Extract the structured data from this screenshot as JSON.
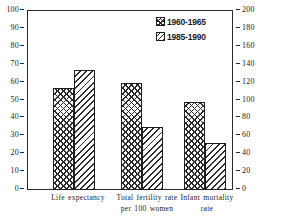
{
  "chart_data": {
    "type": "bar",
    "title": "",
    "subtitle": "",
    "xlabel": "",
    "ylabel": "",
    "grid": false,
    "legend_position": "top-right",
    "categories": [
      "Life expectancy",
      "Total fertility rate per 100 women",
      "Infant mortality rate"
    ],
    "category_lines": [
      [
        "Life expectancy"
      ],
      [
        "Total fertility rate",
        "per 100 women"
      ],
      [
        "Infant mortality",
        "rate"
      ]
    ],
    "series": [
      {
        "name": "1960-1965",
        "pattern": "crosshatch",
        "values": [
          57,
          60,
          49
        ]
      },
      {
        "name": "1985-1990",
        "pattern": "diagonal",
        "values": [
          67,
          35,
          26
        ]
      }
    ],
    "axes": {
      "left": {
        "label": "",
        "ylim": [
          0,
          100
        ],
        "ticks": [
          0,
          10,
          20,
          30,
          40,
          50,
          60,
          70,
          80,
          90,
          100
        ]
      },
      "right": {
        "label": "",
        "ylim": [
          0,
          200
        ],
        "ticks": [
          0,
          20,
          40,
          60,
          80,
          100,
          120,
          140,
          160,
          180,
          200
        ]
      }
    },
    "colors": {
      "ink": "#2b2b2b",
      "background": "#ffffff"
    }
  }
}
